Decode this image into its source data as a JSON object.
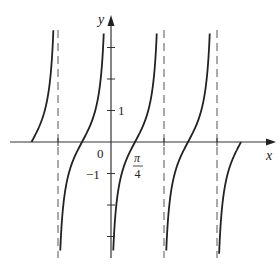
{
  "chart_data": {
    "type": "line",
    "title": "",
    "function": "y = tan(2x - pi/2)  (equivalently y = -cot 2x)",
    "xlabel": "x",
    "ylabel": "y",
    "origin_label": "0",
    "x_tick_labels": [
      {
        "value": "pi/4",
        "num": "π",
        "den": "4"
      }
    ],
    "y_tick_labels": [
      {
        "value": 1,
        "text": "1"
      },
      {
        "value": -1,
        "text": "−1"
      }
    ],
    "y_ticks": [
      -3,
      -2,
      -1,
      1,
      2,
      3
    ],
    "xlim": [
      "-3pi/4",
      "5pi/4"
    ],
    "ylim": [
      -3.6,
      3.6
    ],
    "period": "pi/2",
    "zeros": [
      "-3pi/4",
      "-pi/4",
      "pi/4",
      "3pi/4",
      "5pi/4"
    ],
    "asymptotes": [
      "-pi/2",
      "0",
      "pi/2",
      "pi"
    ],
    "asymptote_style": "dashed",
    "grid": false,
    "legend": null,
    "colors": {
      "curve": "#222222",
      "axes": "#333333",
      "asymptote": "#555555"
    }
  }
}
